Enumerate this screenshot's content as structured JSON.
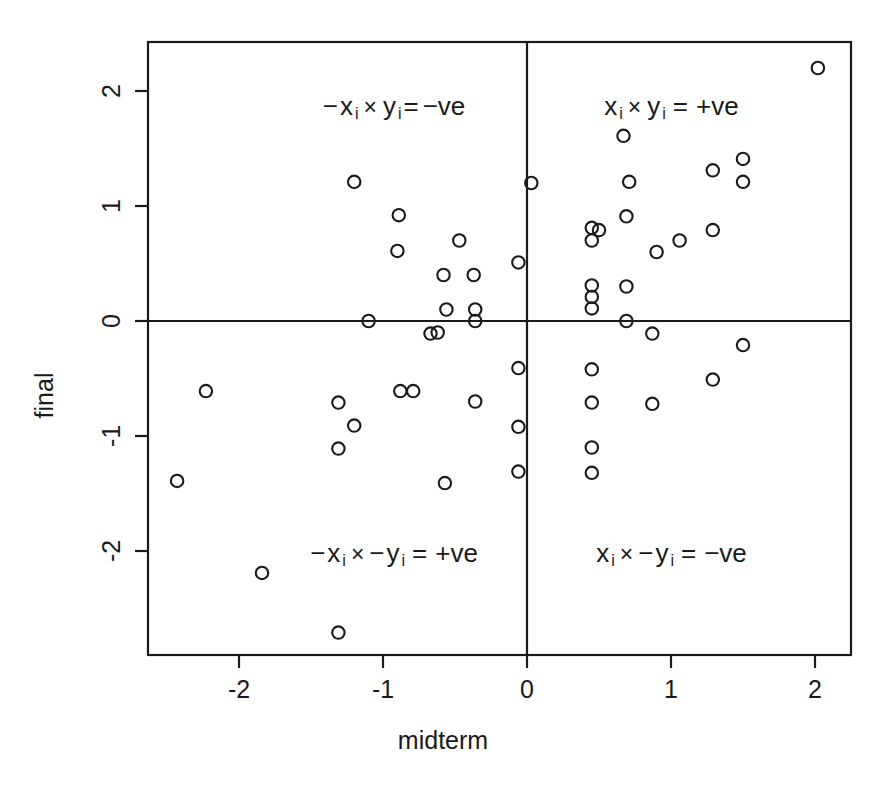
{
  "chart_data": {
    "type": "scatter",
    "title": "",
    "xlabel": "midterm",
    "ylabel": "final",
    "xlim": [
      -2.62,
      2.18
    ],
    "ylim": [
      -2.92,
      2.42
    ],
    "xticks": [
      "-2",
      "-1",
      "0",
      "1",
      "2"
    ],
    "xtick_values": [
      -2,
      -1,
      0,
      1,
      2
    ],
    "yticks": [
      "2",
      "1",
      "0",
      "-1",
      "-2"
    ],
    "ytick_values": [
      2,
      1,
      0,
      -1,
      -2
    ],
    "grid": false,
    "legend": null,
    "marker": "open-circle",
    "reference_lines": [
      {
        "orientation": "horizontal",
        "value": 0
      },
      {
        "orientation": "vertical",
        "value": 0
      }
    ],
    "points": [
      [
        -2.43,
        -1.39
      ],
      [
        -2.23,
        -0.61
      ],
      [
        -1.84,
        -2.19
      ],
      [
        -1.31,
        -0.71
      ],
      [
        -1.2,
        -0.91
      ],
      [
        -1.31,
        -1.11
      ],
      [
        -1.31,
        -2.71
      ],
      [
        -1.2,
        1.21
      ],
      [
        -1.1,
        0.0
      ],
      [
        -0.89,
        0.92
      ],
      [
        -0.9,
        0.61
      ],
      [
        -0.88,
        -0.61
      ],
      [
        -0.79,
        -0.61
      ],
      [
        -0.67,
        -0.11
      ],
      [
        -0.62,
        -0.1
      ],
      [
        -0.58,
        0.4
      ],
      [
        -0.57,
        -1.41
      ],
      [
        -0.56,
        0.1
      ],
      [
        -0.47,
        0.7
      ],
      [
        -0.37,
        0.4
      ],
      [
        -0.36,
        0.1
      ],
      [
        -0.36,
        0.0
      ],
      [
        -0.36,
        -0.7
      ],
      [
        -0.06,
        0.51
      ],
      [
        -0.06,
        -0.41
      ],
      [
        -0.06,
        -0.92
      ],
      [
        -0.06,
        -1.31
      ],
      [
        0.03,
        1.2
      ],
      [
        0.45,
        0.81
      ],
      [
        0.45,
        0.7
      ],
      [
        0.45,
        0.31
      ],
      [
        0.45,
        0.21
      ],
      [
        0.45,
        0.11
      ],
      [
        0.45,
        -0.42
      ],
      [
        0.45,
        -0.71
      ],
      [
        0.45,
        -1.1
      ],
      [
        0.45,
        -1.32
      ],
      [
        0.5,
        0.79
      ],
      [
        0.67,
        1.61
      ],
      [
        0.69,
        0.91
      ],
      [
        0.69,
        0.3
      ],
      [
        0.69,
        0.0
      ],
      [
        0.71,
        1.21
      ],
      [
        0.87,
        -0.11
      ],
      [
        0.87,
        -0.72
      ],
      [
        0.9,
        0.6
      ],
      [
        1.06,
        0.7
      ],
      [
        1.29,
        1.31
      ],
      [
        1.29,
        0.79
      ],
      [
        1.29,
        -0.51
      ],
      [
        1.5,
        1.41
      ],
      [
        1.5,
        1.21
      ],
      [
        1.5,
        -0.21
      ],
      [
        2.02,
        2.2
      ]
    ],
    "quadrant_labels": [
      {
        "quadrant": "top-left",
        "text": "-x_i × y_i= -ve",
        "x": -0.92,
        "y": 1.87
      },
      {
        "quadrant": "top-right",
        "text": "x_i × y_i = +ve",
        "x": 1.0,
        "y": 1.87
      },
      {
        "quadrant": "bottom-left",
        "text": "-x_i × -y_i = +ve",
        "x": -0.92,
        "y": -2.02
      },
      {
        "quadrant": "bottom-right",
        "text": "x_i × -y_i = -ve",
        "x": 1.0,
        "y": -2.02
      }
    ]
  },
  "labels": {
    "x_axis_title": "midterm",
    "y_axis_title": "final",
    "quad_tl": {
      "neg1": "−",
      "var1": "x",
      "sub1": "i",
      "times": "×",
      "neg2": "",
      "var2": "y",
      "sub2": "i",
      "eq": "=",
      "result": "−ve"
    },
    "quad_tr": {
      "neg1": "",
      "var1": "x",
      "sub1": "i",
      "times": "×",
      "neg2": "",
      "var2": "y",
      "sub2": "i",
      "eq": "=",
      "result": "+ve"
    },
    "quad_bl": {
      "neg1": "−",
      "var1": "x",
      "sub1": "i",
      "times": "×",
      "neg2": "−",
      "var2": "y",
      "sub2": "i",
      "eq": "=",
      "result": "+ve"
    },
    "quad_br": {
      "neg1": "",
      "var1": "x",
      "sub1": "i",
      "times": "×",
      "neg2": "−",
      "var2": "y",
      "sub2": "i",
      "eq": "=",
      "result": "−ve"
    }
  },
  "style": {
    "axis_color": "#1a1a1a",
    "point_color": "#1a1a1a",
    "background": "#ffffff"
  }
}
